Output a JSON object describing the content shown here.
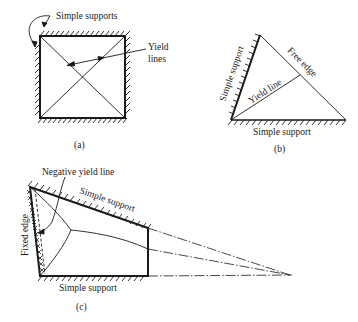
{
  "panels": {
    "a": {
      "caption": "(a)",
      "labels": {
        "supports": "Simple supports",
        "yield_lines_line1": "Yield",
        "yield_lines_line2": "lines"
      }
    },
    "b": {
      "caption": "(b)",
      "labels": {
        "left_edge": "Simple support",
        "free_edge": "Free edge",
        "yield_line": "Yield line",
        "bottom_edge": "Simple support"
      }
    },
    "c": {
      "caption": "(c)",
      "labels": {
        "negative_yield_line": "Negative yield line",
        "top_edge": "Simple support",
        "fixed_edge": "Fixed edge",
        "bottom_edge": "Simple support"
      }
    }
  },
  "colors": {
    "stroke": "#1a1a1a",
    "background": "#ffffff"
  }
}
